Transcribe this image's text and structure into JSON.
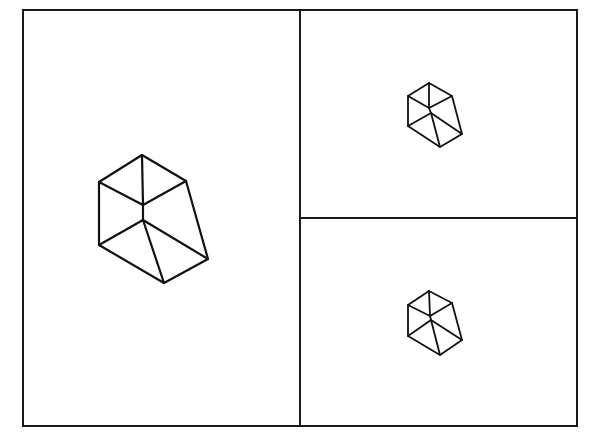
{
  "diagram": {
    "frame": {
      "x1": 23,
      "y1": 10,
      "x2": 577,
      "y2": 426,
      "divider_x": 300,
      "divider_y": 218
    },
    "viewports": [
      {
        "name": "left-viewport",
        "shape": {
          "top": [
            142,
            155
          ],
          "left": [
            99,
            182
          ],
          "right_top": [
            186,
            181
          ],
          "center_top": [
            143,
            205
          ],
          "center_bottom": [
            143,
            220
          ],
          "lower_left": [
            99,
            245
          ],
          "bottom": [
            164,
            283
          ],
          "lower_right": [
            208,
            259
          ]
        }
      },
      {
        "name": "top-right-viewport",
        "shape": {
          "top": [
            429,
            83
          ],
          "left": [
            408,
            96
          ],
          "right_top": [
            452,
            96
          ],
          "center_top": [
            429,
            108
          ],
          "center_bottom": [
            431,
            113
          ],
          "lower_left": [
            408,
            126
          ],
          "bottom": [
            440,
            147
          ],
          "lower_right": [
            462,
            134
          ]
        }
      },
      {
        "name": "bottom-right-viewport",
        "shape": {
          "top": [
            429,
            291
          ],
          "left": [
            408,
            305
          ],
          "right_top": [
            452,
            303
          ],
          "center_top": [
            430,
            316
          ],
          "center_bottom": [
            431,
            320
          ],
          "lower_left": [
            408,
            336
          ],
          "bottom": [
            440,
            355
          ],
          "lower_right": [
            462,
            340
          ]
        }
      }
    ],
    "colors": {
      "line": "#111111",
      "background": "#ffffff"
    }
  }
}
